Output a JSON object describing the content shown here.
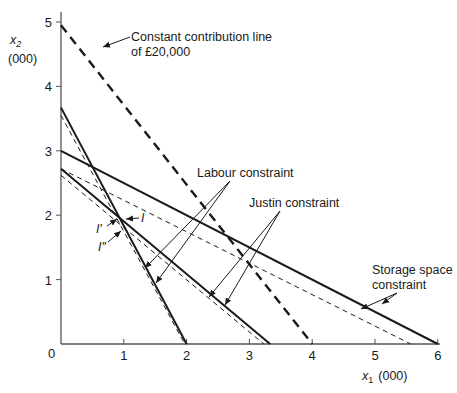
{
  "chart_data": {
    "type": "line",
    "title": "",
    "xlabel": {
      "var": "x",
      "sub": "1",
      "unit": "(000)"
    },
    "ylabel": {
      "var": "x",
      "sub": "2",
      "unit": "(000)"
    },
    "xlim": [
      0,
      6
    ],
    "ylim": [
      0,
      5.2
    ],
    "origin_label": "0",
    "x_ticks": [
      1,
      2,
      3,
      4,
      5,
      6
    ],
    "y_ticks": [
      1,
      2,
      3,
      4,
      5
    ],
    "grid": false,
    "series": [
      {
        "name": "Labour constraint",
        "style": "solid",
        "points": [
          [
            0,
            3.67
          ],
          [
            2,
            0
          ]
        ]
      },
      {
        "name": "Labour constraint (revised)",
        "style": "dashed-thin",
        "points": [
          [
            0,
            3.55
          ],
          [
            1.97,
            0
          ]
        ]
      },
      {
        "name": "Justin constraint",
        "style": "solid",
        "points": [
          [
            0,
            2.72
          ],
          [
            3.33,
            0
          ]
        ]
      },
      {
        "name": "Justin constraint (revised)",
        "style": "dashed-thin",
        "points": [
          [
            0,
            2.62
          ],
          [
            3.23,
            0
          ]
        ]
      },
      {
        "name": "Storage space constraint",
        "style": "solid",
        "points": [
          [
            0,
            3.0
          ],
          [
            6,
            0
          ]
        ]
      },
      {
        "name": "Storage space constraint (revised)",
        "style": "dashed-thin",
        "points": [
          [
            0,
            2.72
          ],
          [
            5.57,
            0
          ]
        ]
      },
      {
        "name": "Constant contribution line of £20,000",
        "style": "dashed-thick",
        "points": [
          [
            0,
            4.95
          ],
          [
            4,
            0
          ]
        ]
      }
    ],
    "annotations": [
      {
        "text": "Constant contribution line",
        "text2": "of £20,000",
        "target_series": "Constant contribution line of £20,000"
      },
      {
        "text": "Labour constraint",
        "targets": [
          "Labour constraint",
          "Labour constraint (revised)"
        ]
      },
      {
        "text": "Justin constraint",
        "targets": [
          "Justin constraint",
          "Justin constraint (revised)"
        ]
      },
      {
        "text": "Storage space",
        "text2": "constraint",
        "targets": [
          "Storage space constraint",
          "Storage space constraint (revised)"
        ]
      }
    ],
    "points": [
      {
        "label": "I",
        "x": 0.97,
        "y": 1.95
      },
      {
        "label": "I′",
        "x": 0.88,
        "y": 1.93
      },
      {
        "label": "I″",
        "x": 0.97,
        "y": 1.77
      }
    ]
  }
}
